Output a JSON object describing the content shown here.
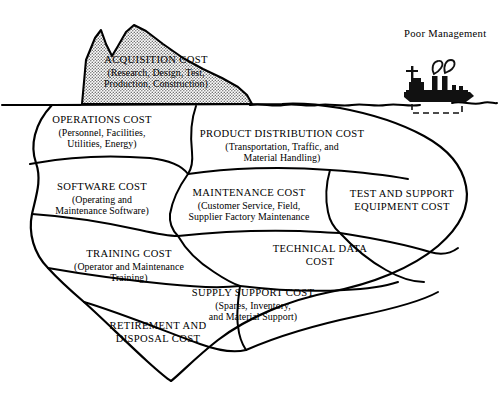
{
  "diagram": {
    "type": "iceberg-diagram",
    "colors": {
      "ink": "#000000",
      "paper": "#ffffff",
      "iceberg_tip_fill": "#cfcfcf",
      "ship_fill": "#111111"
    },
    "waterline": {
      "label": "",
      "y": 105
    },
    "annotation": {
      "ship_label": "Poor Management",
      "ship_icon": "steamship-icon",
      "smoke_icon": "smoke-puffs-icon"
    },
    "above_water": [
      {
        "id": "acquisition-cost",
        "heading": "ACQUISITION COST",
        "detail_lines": [
          "(Research, Design, Test,",
          "Production, Construction)"
        ]
      }
    ],
    "below_water": [
      {
        "id": "operations-cost",
        "heading": "OPERATIONS COST",
        "detail_lines": [
          "(Personnel, Facilities,",
          "Utilities, Energy)"
        ]
      },
      {
        "id": "product-distribution-cost",
        "heading": "PRODUCT DISTRIBUTION COST",
        "detail_lines": [
          "(Transportation, Traffic, and",
          "Material Handling)"
        ]
      },
      {
        "id": "software-cost",
        "heading": "SOFTWARE COST",
        "detail_lines": [
          "(Operating and",
          "Maintenance Software)"
        ]
      },
      {
        "id": "maintenance-cost",
        "heading": "MAINTENANCE COST",
        "detail_lines": [
          "(Customer Service, Field,",
          "Supplier Factory Maintenance"
        ]
      },
      {
        "id": "test-and-support-equipment-cost",
        "heading": "TEST AND SUPPORT",
        "detail_lines": [
          "EQUIPMENT COST"
        ]
      },
      {
        "id": "training-cost",
        "heading": "TRAINING COST",
        "detail_lines": [
          "(Operator and Maintenance",
          "Training)"
        ]
      },
      {
        "id": "technical-data-cost",
        "heading": "TECHNICAL DATA",
        "detail_lines": [
          "COST"
        ]
      },
      {
        "id": "supply-support-cost",
        "heading": "SUPPLY SUPPORT COST",
        "detail_lines": [
          "(Spares, Inventory,",
          "and Material Support)"
        ]
      },
      {
        "id": "retirement-and-disposal-cost",
        "heading": "RETIREMENT AND",
        "detail_lines": [
          "DISPOSAL COST"
        ]
      }
    ]
  }
}
